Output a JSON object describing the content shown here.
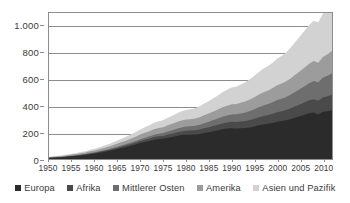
{
  "chart_data": {
    "type": "area",
    "stacked": true,
    "title": "",
    "subtitle": "",
    "xlabel": "",
    "ylabel": "",
    "xlim": [
      1950,
      2012
    ],
    "ylim": [
      0,
      1100
    ],
    "grid": true,
    "legend_position": "bottom",
    "y_ticks": [
      "0",
      "200",
      "400",
      "600",
      "800",
      "1.000"
    ],
    "y_tick_values": [
      0,
      200,
      400,
      600,
      800,
      1000
    ],
    "x_ticks": [
      "1950",
      "1955",
      "1960",
      "1965",
      "1970",
      "1975",
      "1980",
      "1985",
      "1990",
      "1995",
      "2000",
      "2005",
      "2010"
    ],
    "x_tick_values": [
      1950,
      1955,
      1960,
      1965,
      1970,
      1975,
      1980,
      1985,
      1990,
      1995,
      2000,
      2005,
      2010
    ],
    "x": [
      1950,
      1951,
      1952,
      1953,
      1954,
      1955,
      1956,
      1957,
      1958,
      1959,
      1960,
      1961,
      1962,
      1963,
      1964,
      1965,
      1966,
      1967,
      1968,
      1969,
      1970,
      1971,
      1972,
      1973,
      1974,
      1975,
      1976,
      1977,
      1978,
      1979,
      1980,
      1981,
      1982,
      1983,
      1984,
      1985,
      1986,
      1987,
      1988,
      1989,
      1990,
      1991,
      1992,
      1993,
      1994,
      1995,
      1996,
      1997,
      1998,
      1999,
      2000,
      2001,
      2002,
      2003,
      2004,
      2005,
      2006,
      2007,
      2008,
      2009,
      2010,
      2011,
      2012
    ],
    "series": [
      {
        "name": "Europa",
        "color": "#2b2b2b",
        "values": [
          8,
          10,
          12,
          14,
          17,
          20,
          23,
          27,
          31,
          36,
          41,
          47,
          53,
          60,
          67,
          75,
          83,
          91,
          100,
          110,
          120,
          128,
          136,
          145,
          150,
          152,
          160,
          166,
          173,
          180,
          183,
          183,
          184,
          188,
          195,
          201,
          209,
          216,
          224,
          229,
          232,
          230,
          231,
          233,
          238,
          245,
          254,
          260,
          266,
          272,
          281,
          286,
          292,
          301,
          312,
          322,
          334,
          345,
          350,
          336,
          356,
          360,
          368
        ]
      },
      {
        "name": "Afrika",
        "color": "#4a4a4a",
        "values": [
          1,
          1,
          2,
          2,
          2,
          3,
          3,
          4,
          4,
          5,
          5,
          6,
          7,
          8,
          9,
          10,
          11,
          12,
          13,
          14,
          16,
          17,
          19,
          20,
          21,
          22,
          24,
          25,
          27,
          28,
          30,
          31,
          32,
          34,
          36,
          38,
          40,
          42,
          44,
          46,
          48,
          49,
          51,
          53,
          56,
          58,
          61,
          64,
          66,
          69,
          72,
          74,
          77,
          81,
          85,
          89,
          93,
          97,
          101,
          102,
          108,
          112,
          116
        ]
      },
      {
        "name": "Mittlerer Osten",
        "color": "#6e6e6e",
        "values": [
          1,
          1,
          1,
          1,
          2,
          2,
          2,
          3,
          3,
          4,
          4,
          5,
          5,
          6,
          7,
          8,
          9,
          10,
          11,
          12,
          13,
          15,
          16,
          18,
          19,
          21,
          23,
          25,
          27,
          29,
          31,
          32,
          34,
          36,
          39,
          41,
          44,
          47,
          50,
          53,
          56,
          58,
          61,
          64,
          67,
          71,
          75,
          79,
          82,
          86,
          91,
          94,
          98,
          104,
          110,
          116,
          122,
          129,
          136,
          140,
          148,
          155,
          162
        ]
      },
      {
        "name": "Amerika",
        "color": "#9c9c9c",
        "values": [
          4,
          5,
          5,
          6,
          7,
          8,
          9,
          10,
          11,
          13,
          14,
          16,
          17,
          19,
          21,
          23,
          25,
          27,
          30,
          32,
          35,
          37,
          39,
          42,
          43,
          44,
          47,
          49,
          51,
          53,
          54,
          54,
          55,
          57,
          60,
          62,
          65,
          68,
          71,
          74,
          77,
          78,
          81,
          84,
          88,
          92,
          96,
          100,
          103,
          107,
          112,
          114,
          118,
          123,
          129,
          135,
          141,
          147,
          151,
          148,
          157,
          163,
          169
        ]
      },
      {
        "name": "Asien und Pazifik",
        "color": "#d2d2d2",
        "values": [
          3,
          4,
          4,
          5,
          6,
          7,
          8,
          9,
          10,
          12,
          13,
          15,
          17,
          19,
          21,
          24,
          26,
          29,
          32,
          35,
          39,
          42,
          45,
          49,
          51,
          53,
          57,
          61,
          65,
          69,
          72,
          74,
          77,
          82,
          88,
          93,
          100,
          106,
          113,
          119,
          125,
          130,
          137,
          144,
          152,
          161,
          170,
          178,
          184,
          192,
          202,
          209,
          219,
          233,
          248,
          262,
          277,
          292,
          304,
          305,
          326,
          345,
          365
        ]
      }
    ]
  },
  "legend": {
    "items": [
      {
        "label": "Europa",
        "color": "#2b2b2b"
      },
      {
        "label": "Afrika",
        "color": "#4a4a4a"
      },
      {
        "label": "Mittlerer Osten",
        "color": "#6e6e6e"
      },
      {
        "label": "Amerika",
        "color": "#9c9c9c"
      },
      {
        "label": "Asien und Pazifik",
        "color": "#d2d2d2"
      }
    ]
  }
}
